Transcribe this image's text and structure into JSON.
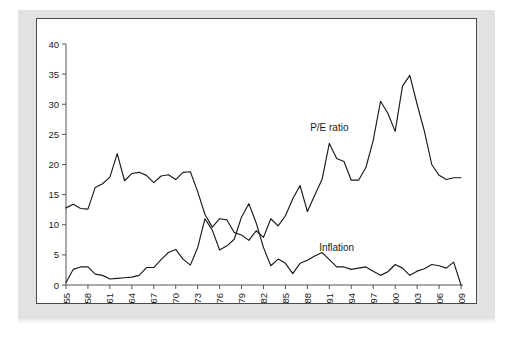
{
  "figure": {
    "background_color": "#ffffff",
    "mat_color": "#e2e2e0",
    "panel_color": "#ffffff",
    "panel_border_color": "#4a4a4a",
    "line_color": "#1a1a1a"
  },
  "chart_data": {
    "type": "line",
    "title": "",
    "subtitle": "",
    "xlabel": "",
    "ylabel": "",
    "xlim": [
      1955,
      2009
    ],
    "ylim": [
      0,
      40
    ],
    "grid": false,
    "legend_position": "inline-annotation",
    "y_ticks": [
      0,
      5,
      10,
      15,
      20,
      25,
      30,
      35,
      40
    ],
    "x_ticks": [
      1955,
      1958,
      1961,
      1964,
      1967,
      1970,
      1973,
      1976,
      1979,
      1982,
      1985,
      1988,
      1991,
      1994,
      1997,
      2000,
      2003,
      2006,
      2009
    ],
    "x": [
      1955,
      1956,
      1957,
      1958,
      1959,
      1960,
      1961,
      1962,
      1963,
      1964,
      1965,
      1966,
      1967,
      1968,
      1969,
      1970,
      1971,
      1972,
      1973,
      1974,
      1975,
      1976,
      1977,
      1978,
      1979,
      1980,
      1981,
      1982,
      1983,
      1984,
      1985,
      1986,
      1987,
      1988,
      1989,
      1990,
      1991,
      1992,
      1993,
      1994,
      1995,
      1996,
      1997,
      1998,
      1999,
      2000,
      2001,
      2002,
      2003,
      2004,
      2005,
      2006,
      2007,
      2008,
      2009
    ],
    "series": [
      {
        "name": "P/E ratio",
        "annotation": "P/E ratio",
        "annotation_x": 1991,
        "annotation_y": 25.5,
        "color": "#1a1a1a",
        "values": [
          12.8,
          13.4,
          12.7,
          12.6,
          16.2,
          16.8,
          17.9,
          21.8,
          17.3,
          18.5,
          18.7,
          18.2,
          17.0,
          18.1,
          18.3,
          17.5,
          18.7,
          18.8,
          15.5,
          11.7,
          9.6,
          11.0,
          10.8,
          8.7,
          8.3,
          7.4,
          9.0,
          7.9,
          11.0,
          9.8,
          11.5,
          14.3,
          16.5,
          12.2,
          14.9,
          17.5,
          23.5,
          21.0,
          20.5,
          17.4,
          17.4,
          19.5,
          24.0,
          30.5,
          28.5,
          25.5,
          33.0,
          34.8,
          30.0,
          25.5,
          20.0,
          18.2,
          17.5,
          17.8,
          17.8
        ]
      },
      {
        "name": "Inflation",
        "annotation": "Inflation",
        "annotation_x": 1992,
        "annotation_y": 5.6,
        "color": "#1a1a1a",
        "values": [
          0.4,
          2.6,
          3.0,
          3.0,
          1.8,
          1.6,
          1.0,
          1.1,
          1.2,
          1.3,
          1.6,
          2.9,
          2.9,
          4.2,
          5.4,
          5.9,
          4.3,
          3.3,
          6.2,
          11.0,
          9.1,
          5.8,
          6.5,
          7.6,
          11.3,
          13.5,
          10.3,
          6.2,
          3.2,
          4.3,
          3.6,
          1.9,
          3.6,
          4.1,
          4.8,
          5.4,
          4.2,
          3.0,
          3.0,
          2.6,
          2.8,
          3.0,
          2.3,
          1.6,
          2.2,
          3.4,
          2.8,
          1.6,
          2.3,
          2.7,
          3.4,
          3.2,
          2.8,
          3.8,
          0.0
        ]
      }
    ]
  }
}
